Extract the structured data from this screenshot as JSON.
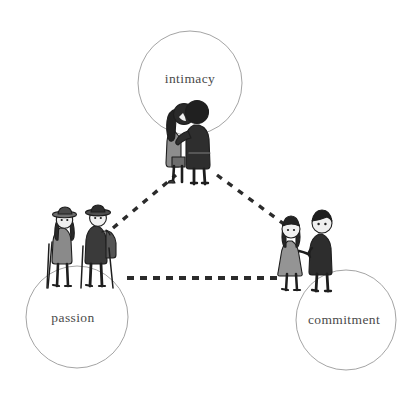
{
  "diagram": {
    "type": "triangle-concept-diagram",
    "background_color": "#ffffff",
    "circle_stroke_color": "#9a9a9a",
    "label_color": "#4a4a4a",
    "connector_color": "#2b2b2b",
    "connector_style": "dashed"
  },
  "nodes": [
    {
      "id": "intimacy",
      "label": "intimacy",
      "circle": {
        "cx": 190,
        "cy": 83,
        "r": 52
      },
      "label_pos": {
        "x": 190,
        "y": 79
      },
      "illustration": "couple-embracing-icon",
      "illustration_pos": {
        "x": 158,
        "y": 96,
        "w": 70,
        "h": 88
      }
    },
    {
      "id": "passion",
      "label": "passion",
      "circle": {
        "cx": 77,
        "cy": 317,
        "r": 51
      },
      "label_pos": {
        "x": 73,
        "y": 318
      },
      "illustration": "two-hikers-icon",
      "illustration_pos": {
        "x": 47,
        "y": 203,
        "w": 78,
        "h": 90
      }
    },
    {
      "id": "commitment",
      "label": "commitment",
      "circle": {
        "cx": 346,
        "cy": 320,
        "r": 50
      },
      "label_pos": {
        "x": 344,
        "y": 320
      },
      "illustration": "couple-holding-hands-icon",
      "illustration_pos": {
        "x": 275,
        "y": 205,
        "w": 72,
        "h": 86
      }
    }
  ],
  "connectors": [
    {
      "id": "intimacy-passion",
      "from": "passion",
      "to": "intimacy",
      "x1": 113,
      "y1": 228,
      "x2": 176,
      "y2": 175
    },
    {
      "id": "intimacy-commitment",
      "from": "intimacy",
      "to": "commitment",
      "x1": 217,
      "y1": 175,
      "x2": 288,
      "y2": 227
    },
    {
      "id": "passion-commitment",
      "from": "passion",
      "to": "commitment",
      "x1": 127,
      "y1": 278,
      "x2": 278,
      "y2": 278
    }
  ]
}
